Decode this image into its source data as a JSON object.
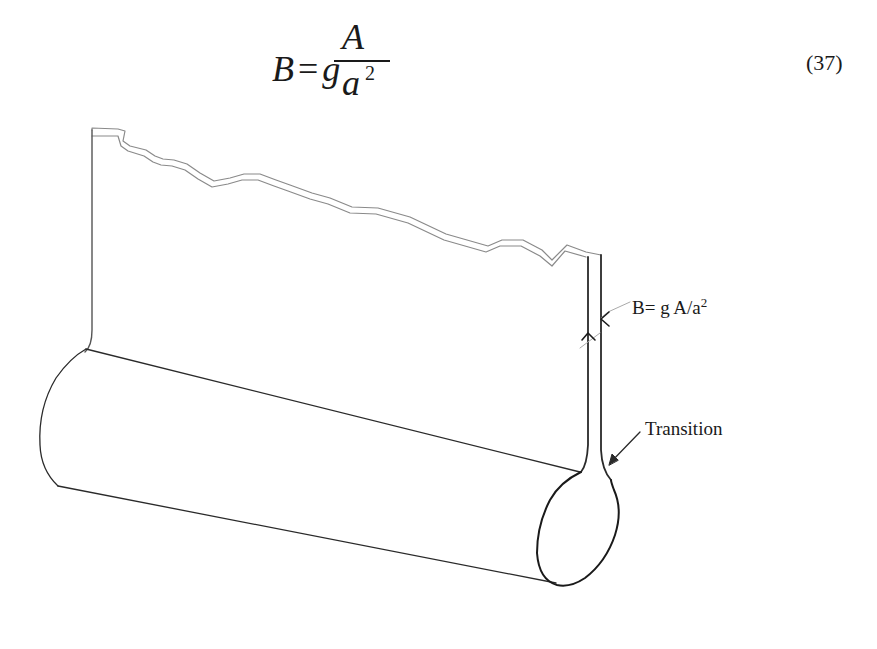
{
  "equation": {
    "lhs": "B",
    "equals": "=",
    "factor": "g",
    "numerator": "A",
    "denominator": "a",
    "exponent": "2",
    "number": "(37)"
  },
  "diagram": {
    "thickness_label": {
      "prefix": "B= g A/a",
      "exponent": "2"
    },
    "transition_label": "Transition",
    "colors": {
      "line": "#2a2a2a",
      "break_line": "#8a8a8a",
      "background": "#ffffff"
    }
  }
}
